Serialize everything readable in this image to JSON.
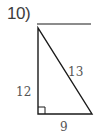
{
  "problem": {
    "number_label": "10)"
  },
  "triangle": {
    "type": "right-triangle",
    "sides": {
      "vertical_leg": "12",
      "hypotenuse": "13",
      "horizontal_leg": "9"
    },
    "right_angle_marker": true,
    "vertices": {
      "top": [
        38,
        28
      ],
      "bottom_left": [
        38,
        114
      ],
      "bottom_right": [
        92,
        114
      ]
    }
  },
  "answer_line": {
    "from": [
      37,
      24
    ],
    "to": [
      91,
      24
    ]
  },
  "colors": {
    "stroke": "#1a1a1a",
    "label_text": "#555555",
    "number_text": "#3d3d3d",
    "background": "#ffffff"
  }
}
